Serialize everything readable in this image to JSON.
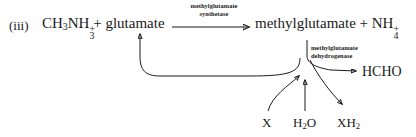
{
  "scheme": {
    "step_numeral": "(iii)",
    "background_color": "#ffffff",
    "ink_color": "#1a1a1a"
  },
  "reaction": {
    "reactants_text": "CH3NH3+ + glutamate",
    "reactants_parts": {
      "methylammonium": {
        "formula": "CH",
        "sub1": "3",
        "mid": "NH",
        "sub2": "3",
        "charge": "+"
      },
      "plus": "+",
      "glutamate": "glutamate"
    },
    "products_text": "methylglutamate + NH4+",
    "products_parts": {
      "methylglutamate": "methylglutamate",
      "plus": "+",
      "ammonium": {
        "formula": "NH",
        "sub": "4",
        "charge": "+"
      }
    },
    "enzymes": [
      {
        "name": "methylglutamate-synthetase",
        "line1": "methylglutamate",
        "line2": "synthetase"
      },
      {
        "name": "methylglutamate-dehydrogenase",
        "line1": "methylglutamate",
        "line2": "dehydrogenase"
      }
    ],
    "cofactors": [
      {
        "name": "oxidized-acceptor",
        "label": "X"
      },
      {
        "name": "water",
        "formula": "H",
        "sub": "2",
        "suffix": "O"
      },
      {
        "name": "reduced-acceptor",
        "formula": "XH",
        "sub": "2"
      }
    ],
    "product_aldehyde": {
      "name": "formaldehyde",
      "label": "HCHO"
    }
  },
  "arrows": [
    {
      "name": "main-reaction-arrow",
      "type": "straight-right",
      "description": "glutamate to methylglutamate via synthetase"
    },
    {
      "name": "glutamate-recycle-arrow",
      "type": "curved-loop-left",
      "description": "regeneration loop returning to glutamate"
    },
    {
      "name": "formaldehyde-output-arrow",
      "type": "curved-right",
      "description": "branch yielding HCHO"
    },
    {
      "name": "acceptor-input-arrow",
      "type": "curved-up-right",
      "description": "X entering the dehydrogenase node"
    },
    {
      "name": "water-input-arrow",
      "type": "straight-up",
      "description": "H2O entering the dehydrogenase node"
    },
    {
      "name": "acceptor-output-arrow",
      "type": "curved-down-right",
      "description": "XH2 leaving the dehydrogenase node"
    }
  ]
}
